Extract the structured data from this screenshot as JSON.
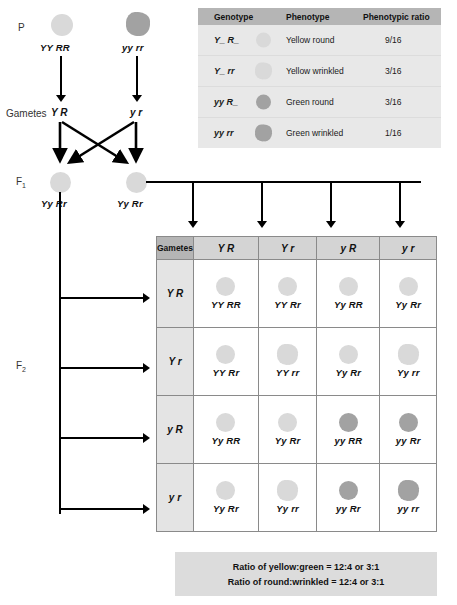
{
  "figure": {
    "type": "dihybrid-cross-punnett-square",
    "generation_labels": {
      "parental": "P",
      "parental_gametes": "Gametes",
      "f1": "F",
      "f1_sub": "1",
      "f2": "F",
      "f2_sub": "2"
    },
    "parents": [
      {
        "genotype": "YY RR",
        "pea": {
          "color": "yellow",
          "shape": "round"
        }
      },
      {
        "genotype": "yy rr",
        "pea": {
          "color": "green",
          "shape": "wrinkled"
        }
      }
    ],
    "parental_gametes": [
      "Y R",
      "y r"
    ],
    "f1_offspring": [
      {
        "genotype": "Yy Rr",
        "pea": {
          "color": "yellow",
          "shape": "round"
        }
      },
      {
        "genotype": "Yy Rr",
        "pea": {
          "color": "yellow",
          "shape": "round"
        }
      }
    ]
  },
  "legend": {
    "headers": [
      "Genotype",
      "Phenotype",
      "Phenotypic ratio"
    ],
    "rows": [
      {
        "genotype": "Y_ R_",
        "phenotype": "Yellow round",
        "ratio": "9/16",
        "pea": {
          "color": "yellow",
          "shape": "round"
        }
      },
      {
        "genotype": "Y_ rr",
        "phenotype": "Yellow wrinkled",
        "ratio": "3/16",
        "pea": {
          "color": "yellow",
          "shape": "wrinkled"
        }
      },
      {
        "genotype": "yy R_",
        "phenotype": "Green round",
        "ratio": "3/16",
        "pea": {
          "color": "green",
          "shape": "round"
        }
      },
      {
        "genotype": "yy rr",
        "phenotype": "Green wrinkled",
        "ratio": "1/16",
        "pea": {
          "color": "green",
          "shape": "wrinkled"
        }
      }
    ]
  },
  "punnett": {
    "corner_label": "Gametes",
    "col_gametes": [
      "Y R",
      "Y r",
      "y R",
      "y r"
    ],
    "row_gametes": [
      "Y R",
      "Y r",
      "y R",
      "y r"
    ],
    "cells": [
      [
        {
          "genotype": "YY RR",
          "pea": {
            "color": "yellow",
            "shape": "round"
          }
        },
        {
          "genotype": "YY Rr",
          "pea": {
            "color": "yellow",
            "shape": "round"
          }
        },
        {
          "genotype": "Yy RR",
          "pea": {
            "color": "yellow",
            "shape": "round"
          }
        },
        {
          "genotype": "Yy Rr",
          "pea": {
            "color": "yellow",
            "shape": "round"
          }
        }
      ],
      [
        {
          "genotype": "YY Rr",
          "pea": {
            "color": "yellow",
            "shape": "round"
          }
        },
        {
          "genotype": "YY rr",
          "pea": {
            "color": "yellow",
            "shape": "wrinkled"
          }
        },
        {
          "genotype": "Yy Rr",
          "pea": {
            "color": "yellow",
            "shape": "round"
          }
        },
        {
          "genotype": "Yy rr",
          "pea": {
            "color": "yellow",
            "shape": "wrinkled"
          }
        }
      ],
      [
        {
          "genotype": "Yy RR",
          "pea": {
            "color": "yellow",
            "shape": "round"
          }
        },
        {
          "genotype": "Yy Rr",
          "pea": {
            "color": "yellow",
            "shape": "round"
          }
        },
        {
          "genotype": "yy RR",
          "pea": {
            "color": "green",
            "shape": "round"
          }
        },
        {
          "genotype": "yy Rr",
          "pea": {
            "color": "green",
            "shape": "round"
          }
        }
      ],
      [
        {
          "genotype": "Yy Rr",
          "pea": {
            "color": "yellow",
            "shape": "round"
          }
        },
        {
          "genotype": "Yy rr",
          "pea": {
            "color": "yellow",
            "shape": "wrinkled"
          }
        },
        {
          "genotype": "yy Rr",
          "pea": {
            "color": "green",
            "shape": "round"
          }
        },
        {
          "genotype": "yy rr",
          "pea": {
            "color": "green",
            "shape": "wrinkled"
          }
        }
      ]
    ]
  },
  "ratios": [
    "Ratio of yellow:green = 12:4 or 3:1",
    "Ratio of round:wrinkled = 12:4 or 3:1"
  ],
  "colors": {
    "pea_yellow": "#d9d9d9",
    "pea_green": "#a2a2a2",
    "header_dark": "#b5b5b5",
    "header_mid": "#d4d4d4",
    "row_head": "#e4e4e4",
    "legend_bg": "#e8e8e8",
    "ratio_bg": "#dcdcdc",
    "grid_line": "#8a8a8a",
    "arrow": "#000000"
  }
}
